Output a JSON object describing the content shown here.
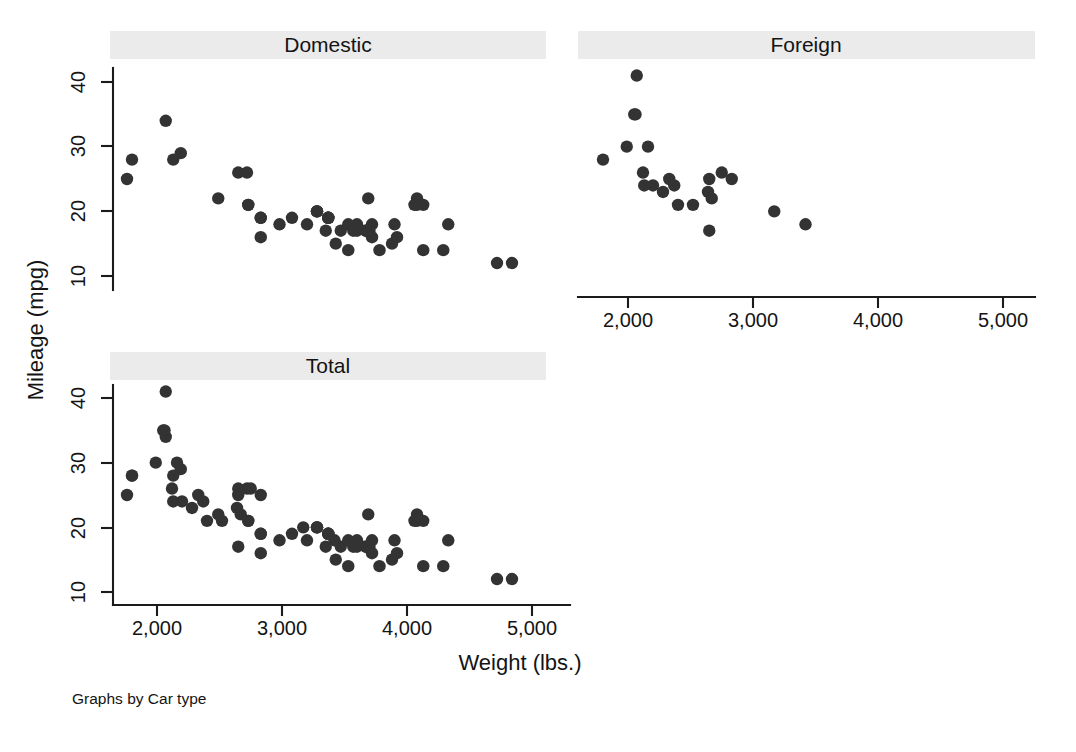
{
  "figure": {
    "note": "Graphs by Car type",
    "xlabel": "Weight (lbs.)",
    "ylabel": "Mileage (mpg)",
    "strip_color": "#ebebeb",
    "marker_color": "#333333",
    "axis_color": "#1b1b1b"
  },
  "panels": [
    {
      "key": "domestic",
      "title": "Domestic"
    },
    {
      "key": "foreign",
      "title": "Foreign"
    },
    {
      "key": "total",
      "title": "Total"
    }
  ],
  "axes": {
    "x_ticks": [
      "2,000",
      "3,000",
      "4,000",
      "5,000"
    ],
    "x_tick_values": [
      2000,
      3000,
      4000,
      5000
    ],
    "y_ticks": [
      "10",
      "20",
      "30",
      "40"
    ],
    "y_tick_values": [
      10,
      20,
      30,
      40
    ],
    "xlim": [
      1600,
      5100
    ],
    "ylim": [
      8,
      44
    ]
  },
  "chart_data": {
    "type": "scatter",
    "title": "",
    "subtitle": "",
    "xlabel": "Weight (lbs.)",
    "ylabel": "Mileage (mpg)",
    "xlim": [
      1600,
      5100
    ],
    "ylim": [
      8,
      44
    ],
    "grid": false,
    "legend": "none",
    "note": "Graphs by Car type",
    "panel_titles": [
      "Domestic",
      "Foreign",
      "Total"
    ],
    "panel_layout": "2x2 (Domestic top-left, Foreign top-right, Total bottom-left)",
    "x_tick_labels": [
      "2,000",
      "3,000",
      "4,000",
      "5,000"
    ],
    "y_tick_labels": [
      "10",
      "20",
      "30",
      "40"
    ],
    "series": [
      {
        "name": "Domestic",
        "panel": "Domestic",
        "n": 52,
        "x": [
          4080,
          3670,
          3690,
          3280,
          3880,
          4330,
          3900,
          4290,
          4080,
          3670,
          3920,
          3690,
          3370,
          2730,
          3470,
          3600,
          3700,
          3370,
          4130,
          3600,
          3720,
          3370,
          2830,
          2070,
          3530,
          3080,
          3350,
          2130,
          2190,
          2650,
          2720,
          3690,
          3370,
          2830,
          2730,
          2980,
          3280,
          3430,
          3280,
          4060,
          3720,
          3780,
          3570,
          4840,
          4720,
          4130,
          3200,
          3530,
          2830,
          1800,
          1760,
          2490
        ],
        "y": [
          22,
          17,
          22,
          20,
          15,
          18,
          18,
          14,
          21,
          17,
          16,
          17,
          19,
          21,
          17,
          18,
          17,
          19,
          21,
          17,
          18,
          19,
          19,
          34,
          18,
          19,
          17,
          28,
          29,
          26,
          26,
          17,
          19,
          19,
          21,
          18,
          20,
          15,
          20,
          21,
          16,
          14,
          17,
          12,
          12,
          14,
          18,
          14,
          16,
          28,
          25,
          22
        ],
        "marker": "circle"
      },
      {
        "name": "Foreign",
        "panel": "Foreign",
        "n": 22,
        "x": [
          2640,
          2830,
          2070,
          2650,
          2060,
          2160,
          2670,
          2370,
          2750,
          3170,
          2280,
          2200,
          2520,
          2330,
          1800,
          1990,
          3420,
          2400,
          2120,
          2050,
          2130,
          2650
        ],
        "y": [
          23,
          25,
          41,
          25,
          35,
          30,
          22,
          24,
          26,
          20,
          23,
          24,
          21,
          25,
          28,
          30,
          18,
          21,
          26,
          35,
          24,
          17
        ],
        "marker": "circle"
      },
      {
        "name": "Total",
        "panel": "Total",
        "n": 74,
        "x": [
          4080,
          3670,
          3690,
          3280,
          3880,
          4330,
          3900,
          4290,
          4080,
          3670,
          3920,
          3690,
          3370,
          2730,
          3470,
          3600,
          3700,
          3370,
          4130,
          3600,
          3720,
          3370,
          2830,
          2070,
          3530,
          3080,
          3350,
          2130,
          2190,
          2650,
          2720,
          3690,
          3370,
          2830,
          2730,
          2980,
          3280,
          3430,
          3280,
          4060,
          3720,
          3780,
          3570,
          4840,
          4720,
          4130,
          3200,
          3530,
          2830,
          1800,
          1760,
          2490,
          2640,
          2830,
          2070,
          2650,
          2060,
          2160,
          2670,
          2370,
          2750,
          3170,
          2280,
          2200,
          2520,
          2330,
          1800,
          1990,
          3420,
          2400,
          2120,
          2050,
          2130,
          2650
        ],
        "y": [
          22,
          17,
          22,
          20,
          15,
          18,
          18,
          14,
          21,
          17,
          16,
          17,
          19,
          21,
          17,
          18,
          17,
          19,
          21,
          17,
          18,
          19,
          19,
          34,
          18,
          19,
          17,
          28,
          29,
          26,
          26,
          17,
          19,
          19,
          21,
          18,
          20,
          15,
          20,
          21,
          16,
          14,
          17,
          12,
          12,
          14,
          18,
          14,
          16,
          28,
          25,
          22,
          23,
          25,
          41,
          25,
          35,
          30,
          22,
          24,
          26,
          20,
          23,
          24,
          21,
          25,
          28,
          30,
          18,
          21,
          26,
          35,
          24,
          17
        ],
        "marker": "circle"
      }
    ]
  }
}
